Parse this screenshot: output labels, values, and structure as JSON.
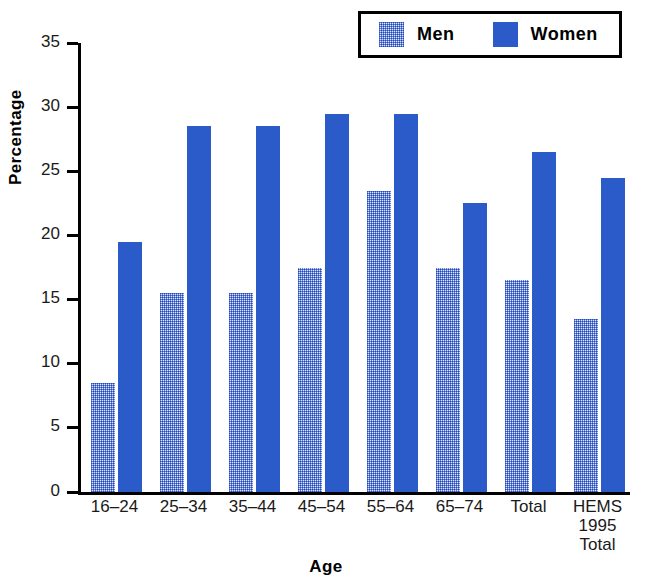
{
  "chart_data": {
    "type": "bar",
    "title": "",
    "xlabel": "Age",
    "ylabel": "Percentage",
    "ylim": [
      0,
      35
    ],
    "yticks": [
      0,
      5,
      10,
      15,
      20,
      25,
      30,
      35
    ],
    "grid": false,
    "legend_position": "top-right",
    "categories": [
      "16–24",
      "25–34",
      "35–44",
      "45–54",
      "55–64",
      "65–74",
      "Total",
      "HEMS\n1995\nTotal"
    ],
    "series": [
      {
        "name": "Men",
        "color": "#9fb4e8",
        "pattern": "stipple",
        "values": [
          8.5,
          15.5,
          15.5,
          17.5,
          23.5,
          17.5,
          16.5,
          13.5
        ]
      },
      {
        "name": "Women",
        "color": "#2a5bc8",
        "pattern": "solid",
        "values": [
          19.5,
          28.5,
          28.5,
          29.5,
          29.5,
          22.5,
          26.5,
          24.5
        ]
      }
    ]
  },
  "legend": {
    "entries": [
      {
        "label": "Men",
        "swatch": "men-swatch"
      },
      {
        "label": "Women",
        "swatch": "women-swatch"
      }
    ]
  },
  "axes": {
    "y_title": "Percentage",
    "x_title": "Age",
    "y_tick_labels": [
      "35",
      "30",
      "25",
      "20",
      "15",
      "10",
      "5",
      "0"
    ]
  },
  "colors": {
    "women_blue": "#2a5bc8",
    "men_light_blue": "#9fb4e8",
    "axis_black": "#000000",
    "background": "#ffffff"
  }
}
